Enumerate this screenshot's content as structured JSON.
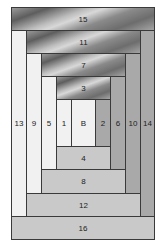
{
  "colors": {
    "light": "#f1f1f1",
    "medium": "#a9a9a9",
    "pale": "#c9c9c9",
    "metallic": "#8a8a8a",
    "outline": "#3a3a3a"
  },
  "pieces": {
    "p15": "15",
    "p11": "11",
    "p7": "7",
    "p3": "3",
    "p13": "13",
    "p9": "9",
    "p5": "5",
    "p1": "1",
    "center": "B",
    "p2": "2",
    "p6": "6",
    "p10": "10",
    "p14": "14",
    "p4": "4",
    "p8": "8",
    "p12": "12",
    "p16": "16"
  }
}
